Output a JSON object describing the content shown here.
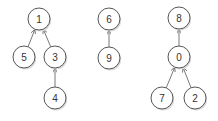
{
  "diagram": {
    "type": "forest",
    "nodes": [
      {
        "id": "1",
        "label": "1",
        "x": 39,
        "y": 19
      },
      {
        "id": "5",
        "label": "5",
        "x": 24,
        "y": 57
      },
      {
        "id": "3",
        "label": "3",
        "x": 55,
        "y": 57
      },
      {
        "id": "4",
        "label": "4",
        "x": 55,
        "y": 98
      },
      {
        "id": "6",
        "label": "6",
        "x": 109,
        "y": 19
      },
      {
        "id": "9",
        "label": "9",
        "x": 109,
        "y": 58
      },
      {
        "id": "8",
        "label": "8",
        "x": 179,
        "y": 18
      },
      {
        "id": "0",
        "label": "0",
        "x": 179,
        "y": 57
      },
      {
        "id": "7",
        "label": "7",
        "x": 162,
        "y": 98
      },
      {
        "id": "2",
        "label": "2",
        "x": 195,
        "y": 98
      }
    ],
    "edges": [
      {
        "from": "5",
        "to": "1"
      },
      {
        "from": "3",
        "to": "1"
      },
      {
        "from": "4",
        "to": "3"
      },
      {
        "from": "9",
        "to": "6"
      },
      {
        "from": "0",
        "to": "8"
      },
      {
        "from": "7",
        "to": "0"
      },
      {
        "from": "2",
        "to": "0"
      }
    ],
    "node_radius": 11
  }
}
